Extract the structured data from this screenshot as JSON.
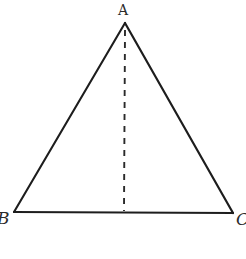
{
  "figure": {
    "kind": "geometry-diagram",
    "background_color": "#ffffff",
    "stroke_color": "#1d1d1d",
    "stroke_width": 2.1,
    "width": 246,
    "height": 259
  },
  "labels": {
    "apex": "A",
    "bottom_left": "B",
    "bottom_right": "C"
  },
  "geometry": {
    "apex": {
      "x": 125,
      "y": 23
    },
    "bottom_left": {
      "x": 14,
      "y": 212
    },
    "bottom_right": {
      "x": 233,
      "y": 213
    },
    "foot_of_altitude": {
      "x": 124,
      "y": 212
    },
    "side_left_path": "M 125 23 L 14 212",
    "side_right_path": "M 125 23 L 233 213",
    "base_path": "M 14 212 L 233 213",
    "altitude_path": "M 125 30 L 124 211",
    "altitude_dash_pattern": "6 6"
  }
}
